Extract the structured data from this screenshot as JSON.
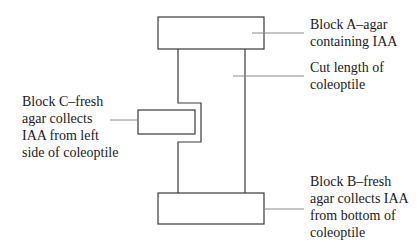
{
  "diagram": {
    "title": "",
    "labels": {
      "block_a": {
        "lines": [
          "Block A–agar",
          "containing IAA"
        ]
      },
      "cut_length": {
        "lines": [
          "Cut length of",
          "coleoptile"
        ]
      },
      "block_c": {
        "lines": [
          "Block C–fresh",
          "agar collects",
          "IAA from left",
          "side of coleoptile"
        ]
      },
      "block_b": {
        "lines": [
          "Block B–fresh",
          "agar collects IAA",
          "from bottom of",
          "coleoptile"
        ]
      }
    },
    "colors": {
      "stroke": "#3a3a3a",
      "leader": "#8a8a8a",
      "text": "#1a1a1a",
      "background": "#ffffff"
    }
  }
}
